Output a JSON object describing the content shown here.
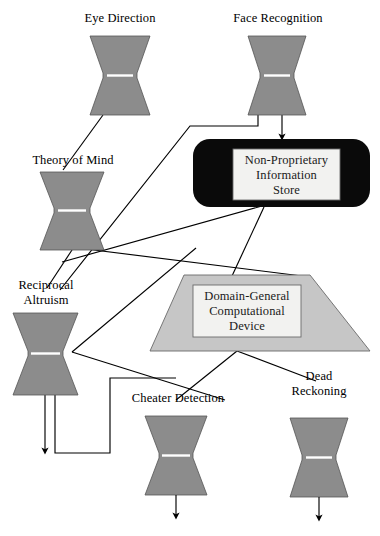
{
  "diagram": {
    "colors": {
      "module_fill": "#8c8c8c",
      "module_stroke": "#555555",
      "store_fill": "#0a0a0a",
      "store_inner_fill": "#f2f2f0",
      "device_fill": "#c6c6c6",
      "device_inner_fill": "#f2f2f0",
      "line": "#000000",
      "waist_line": "#ffffff",
      "background": "#ffffff"
    },
    "modules": [
      {
        "id": "eye-direction",
        "label": "Eye Direction",
        "label_lines": [
          "Eye Direction"
        ]
      },
      {
        "id": "face-recognition",
        "label": "Face Recognition",
        "label_lines": [
          "Face Recognition"
        ]
      },
      {
        "id": "theory-of-mind",
        "label": "Theory of Mind",
        "label_lines": [
          "Theory of Mind"
        ]
      },
      {
        "id": "reciprocal-altruism",
        "label": "Reciprocal Altruism",
        "label_lines": [
          "Reciprocal",
          "Altruism"
        ]
      },
      {
        "id": "cheater-detection",
        "label": "Cheater Detection",
        "label_lines": [
          "Cheater Detection"
        ]
      },
      {
        "id": "dead-reckoning",
        "label": "Dead Reckoning",
        "label_lines": [
          "Dead",
          "Reckoning"
        ]
      }
    ],
    "store": {
      "id": "non-proprietary-information-store",
      "label": "Non-Proprietary Information Store",
      "lines": [
        "Non-Proprietary",
        "Information",
        "Store"
      ]
    },
    "device": {
      "id": "domain-general-computational-device",
      "label": "Domain-General Computational Device",
      "lines": [
        "Domain-General",
        "Computational",
        "Device"
      ]
    }
  }
}
